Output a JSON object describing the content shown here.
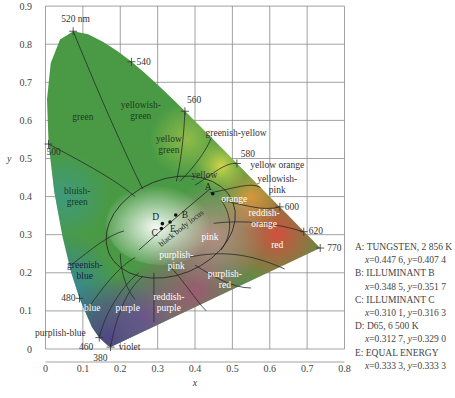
{
  "chart_data": {
    "type": "scatter",
    "xlabel": "x",
    "ylabel": "y",
    "xlim": [
      0,
      0.8
    ],
    "ylim": [
      0,
      0.9
    ],
    "grid": true,
    "x_ticks": [
      "0",
      "0.1",
      "0.2",
      "0.3",
      "0.4",
      "0.5",
      "0.6",
      "0.7",
      "0.8"
    ],
    "y_ticks": [
      "0",
      "0.1",
      "0.2",
      "0.3",
      "0.4",
      "0.5",
      "0.6",
      "0.7",
      "0.8",
      "0.9"
    ],
    "spectral_locus_labels": [
      {
        "label": "520 nm",
        "x": 0.074,
        "y": 0.834
      },
      {
        "label": "540",
        "x": 0.23,
        "y": 0.754
      },
      {
        "label": "560",
        "x": 0.373,
        "y": 0.624
      },
      {
        "label": "580",
        "x": 0.512,
        "y": 0.487
      },
      {
        "label": "600",
        "x": 0.627,
        "y": 0.373
      },
      {
        "label": "620",
        "x": 0.691,
        "y": 0.308
      },
      {
        "label": "770",
        "x": 0.735,
        "y": 0.265
      },
      {
        "label": "500",
        "x": 0.008,
        "y": 0.538
      },
      {
        "label": "480",
        "x": 0.091,
        "y": 0.133
      },
      {
        "label": "460",
        "x": 0.144,
        "y": 0.03
      },
      {
        "label": "380",
        "x": 0.174,
        "y": 0.005
      }
    ],
    "region_labels": [
      "green",
      "yellowish-green",
      "yellow green",
      "greenish-yellow",
      "yellow",
      "yellow orange",
      "yellowish-pink",
      "orange",
      "reddish-orange",
      "red",
      "pink",
      "purplish-pink",
      "purplish-red",
      "reddish-purple",
      "purple",
      "violet",
      "blue",
      "purplish-blue",
      "greenish-blue",
      "bluish-green"
    ],
    "curve_label": "black body locus",
    "series": [
      {
        "name": "A: TUNGSTEN, 2 856 K",
        "x": 0.4476,
        "y": 0.4074
      },
      {
        "name": "B: ILLUMINANT B",
        "x": 0.3485,
        "y": 0.3517
      },
      {
        "name": "C: ILLUMINANT C",
        "x": 0.3101,
        "y": 0.3163
      },
      {
        "name": "D: D65, 6 500 K",
        "x": 0.3127,
        "y": 0.329
      },
      {
        "name": "E: EQUAL ENERGY",
        "x": 0.3333,
        "y": 0.3333
      }
    ],
    "legend_position": "right"
  },
  "legend": [
    {
      "title": "A: TUNGSTEN, 2 856 K",
      "x": "0.447 6",
      "y": "0.407 4"
    },
    {
      "title": "B: ILLUMINANT B",
      "x": "0.348 5",
      "y": "0.351 7"
    },
    {
      "title": "C: ILLUMINANT C",
      "x": "0.310 1",
      "y": "0.316 3"
    },
    {
      "title": "D: D65, 6 500 K",
      "x": "0.312 7",
      "y": "0.329 0"
    },
    {
      "title": "E: EQUAL ENERGY",
      "x": "0.333 3",
      "y": "0.333 3"
    }
  ],
  "coord_prefix_x": "x=",
  "coord_prefix_y": ", y="
}
